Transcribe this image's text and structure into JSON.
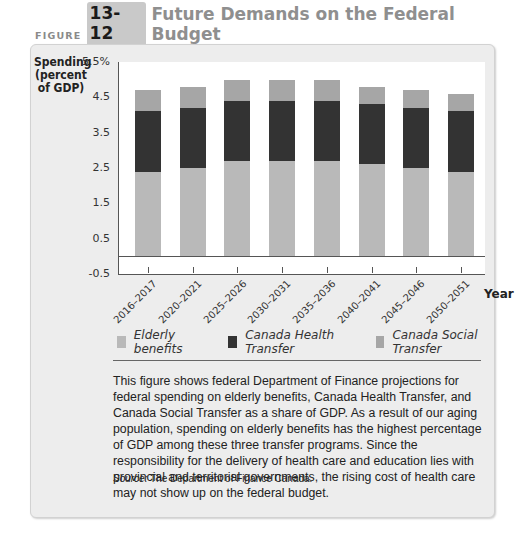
{
  "figure": {
    "label": "FIGURE",
    "number": "13-12",
    "title": "Future Demands on the Federal Budget"
  },
  "colors": {
    "elderly": "#b9b9b9",
    "health": "#333333",
    "social": "#a6a6a6",
    "panel": "#ededed"
  },
  "chart_data": {
    "type": "bar",
    "stacked": true,
    "title": "Future Demands on the Federal Budget",
    "xlabel": "Year",
    "ylabel": "Spending (percent of GDP)",
    "ylim": [
      -0.5,
      5.5
    ],
    "yticks": [
      "5.5%",
      "4.5",
      "3.5",
      "2.5",
      "1.5",
      "0.5",
      "-0.5"
    ],
    "grid": false,
    "legend_position": "bottom",
    "categories": [
      "2016–2017",
      "2020–2021",
      "2025–2026",
      "2030–2031",
      "2035–2036",
      "2040–2041",
      "2045–2046",
      "2050–2051"
    ],
    "series": [
      {
        "name": "Elderly benefits",
        "values": [
          2.4,
          2.5,
          2.7,
          2.7,
          2.7,
          2.6,
          2.5,
          2.4
        ]
      },
      {
        "name": "Canada Health Transfer",
        "values": [
          1.7,
          1.7,
          1.7,
          1.7,
          1.7,
          1.7,
          1.7,
          1.7
        ]
      },
      {
        "name": "Canada Social Transfer",
        "values": [
          0.6,
          0.6,
          0.6,
          0.6,
          0.6,
          0.5,
          0.5,
          0.5
        ]
      }
    ]
  },
  "y_axis_label_lines": [
    "Spending",
    "(percent",
    "of GDP)"
  ],
  "year_label": "Year",
  "legend": [
    {
      "label": "Elderly benefits"
    },
    {
      "label": "Canada Health Transfer"
    },
    {
      "label": "Canada Social Transfer"
    }
  ],
  "caption": "This figure shows federal Department of Finance projections for federal spending on elderly benefits, Canada Health Transfer, and Canada Social Transfer as a share of GDP. As a result of our aging population, spending on elderly benefits has the highest percentage of GDP among these three transfer programs. Since the responsibility for the delivery of health care and education lies with provincial and territorial governments, the rising cost of health care may not show up on the federal budget.",
  "source": {
    "prefix": "Source:",
    "text": " The Department of Finance Canada."
  }
}
